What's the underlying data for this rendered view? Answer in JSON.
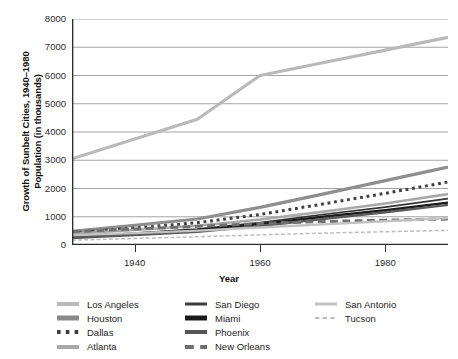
{
  "chart_data": {
    "type": "line",
    "title": "",
    "ylabel": "Growth of Sunbelt Cities, 1940–1980\nPopulation (in thousands)",
    "xlabel": "Year",
    "xlim": [
      1930,
      1990
    ],
    "ylim": [
      0,
      8000
    ],
    "xticks": [
      1940,
      1960,
      1980
    ],
    "yticks": [
      0,
      1000,
      2000,
      3000,
      4000,
      5000,
      6000,
      7000,
      8000
    ],
    "grid": true,
    "legend_position": "below",
    "x": [
      1930,
      1940,
      1950,
      1960,
      1970,
      1980,
      1990
    ],
    "series": [
      {
        "name": "Los Angeles",
        "values": [
          3050,
          3750,
          4450,
          6000,
          6450,
          6900,
          7350
        ],
        "color": "#b9b9b9",
        "style": "solid",
        "width": 3.2
      },
      {
        "name": "Houston",
        "values": [
          480,
          700,
          920,
          1330,
          1800,
          2280,
          2760
        ],
        "color": "#8e8e8e",
        "style": "solid",
        "width": 3.2
      },
      {
        "name": "Dallas",
        "values": [
          430,
          600,
          790,
          1080,
          1450,
          1830,
          2230
        ],
        "color": "#404040",
        "style": "dotted",
        "width": 3.0
      },
      {
        "name": "Atlanta",
        "values": [
          400,
          530,
          680,
          900,
          1180,
          1470,
          1800
        ],
        "color": "#a8a8a8",
        "style": "solid",
        "width": 2.6
      },
      {
        "name": "San Diego",
        "values": [
          300,
          420,
          560,
          790,
          1080,
          1340,
          1640
        ],
        "color": "#333333",
        "style": "solid",
        "width": 1.7
      },
      {
        "name": "Miami",
        "values": [
          290,
          400,
          530,
          740,
          1000,
          1230,
          1500
        ],
        "color": "#1a1a1a",
        "style": "solid",
        "width": 2.4
      },
      {
        "name": "Phoenix",
        "values": [
          250,
          350,
          470,
          670,
          920,
          1160,
          1420
        ],
        "color": "#5a5a5a",
        "style": "solid",
        "width": 2.4
      },
      {
        "name": "New Orleans",
        "values": [
          470,
          570,
          660,
          760,
          830,
          880,
          920
        ],
        "color": "#707070",
        "style": "dashed",
        "width": 3.0
      },
      {
        "name": "San Antonio",
        "values": [
          340,
          420,
          510,
          620,
          730,
          840,
          950
        ],
        "color": "#c2c2c2",
        "style": "solid",
        "width": 2.4
      },
      {
        "name": "Tucson",
        "values": [
          170,
          230,
          290,
          360,
          420,
          470,
          520
        ],
        "color": "#bdbdbd",
        "style": "dashed",
        "width": 1.5
      }
    ]
  },
  "axes": {
    "ytitle": "Growth of Sunbelt Cities, 1940–1980\nPopulation (in thousands)",
    "xtitle": "Year",
    "ytick_labels": [
      "8000",
      "7000",
      "6000",
      "5000",
      "4000",
      "3000",
      "2000",
      "1000",
      "0"
    ],
    "xtick_labels": [
      "1940",
      "1960",
      "1980"
    ]
  },
  "legend": {
    "columns": [
      {
        "items": [
          {
            "label": "Los Angeles",
            "color": "#b9b9b9",
            "style": "solid",
            "width": 4
          },
          {
            "label": "Houston",
            "color": "#8a8a8a",
            "style": "solid",
            "width": 5
          },
          {
            "label": "Dallas",
            "color": "#3d3d3d",
            "style": "dotted",
            "width": 4
          },
          {
            "label": "Atlanta",
            "color": "#a8a8a8",
            "style": "solid",
            "width": 4
          }
        ]
      },
      {
        "items": [
          {
            "label": "San Diego",
            "color": "#3a3a3a",
            "style": "solid",
            "width": 3
          },
          {
            "label": "Miami",
            "color": "#1a1a1a",
            "style": "solid",
            "width": 5
          },
          {
            "label": "Phoenix",
            "color": "#565656",
            "style": "solid",
            "width": 4
          },
          {
            "label": "New Orleans",
            "color": "#6e6e6e",
            "style": "dashed",
            "width": 4
          }
        ]
      },
      {
        "items": [
          {
            "label": "San Antonio",
            "color": "#c2c2c2",
            "style": "solid",
            "width": 3
          },
          {
            "label": "Tucson",
            "color": "#bdbdbd",
            "style": "dashed",
            "width": 2
          }
        ]
      }
    ]
  },
  "colors": {
    "background": "#ffffff",
    "grid": "#9a9a9a",
    "axis": "#2e2e2e",
    "text": "#1a1a1a"
  }
}
